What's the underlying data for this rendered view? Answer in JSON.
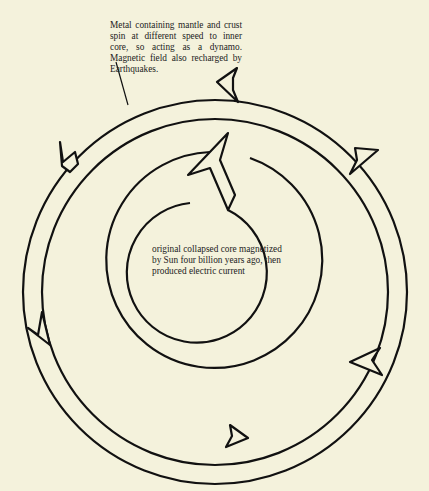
{
  "diagram": {
    "annotation_outer": "Metal containing mantle and crust spin at different speed to inner core, so acting as a dynamo. Magnetic field also recharged by Earthquakes.",
    "annotation_core": "original collapsed core magnetized by Sun four billion years ago, then produced electric current",
    "colors": {
      "background": "#f4f2dc",
      "line": "#111111",
      "text": "#222222"
    }
  }
}
